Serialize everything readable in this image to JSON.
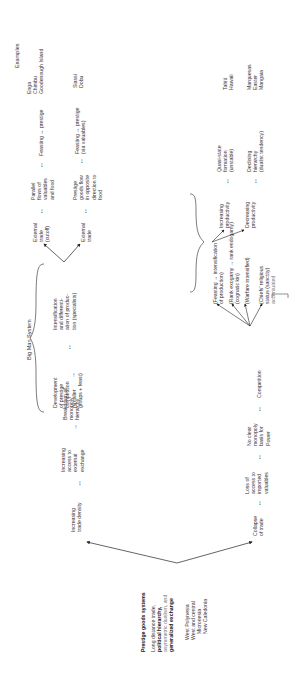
{
  "root": {
    "title": "Prestige goods systems",
    "lines": [
      "Long distance trade,",
      "political hierarchy,",
      "asymmetric dualism, and",
      "generalized exchange"
    ],
    "examples": [
      "West Polynesia",
      "West and central",
      "Micronesia",
      "New Caledonia"
    ]
  },
  "examples_header": "Examples",
  "upper_branch": {
    "start": [
      "Increasing",
      "trade density"
    ],
    "step2": [
      "Increasing",
      "access to",
      "external",
      "exchange"
    ],
    "step3": [
      "Breakdown of",
      "monopoly",
      "hierarchy"
    ],
    "big_man_label": "Big Man System",
    "step4": [
      "Development",
      "of prestige",
      "competition",
      "(smaller",
      "groups + feast)"
    ],
    "step5": [
      "Intensification",
      "and differenti-",
      "ation of produc-",
      "tion (specialists)"
    ],
    "row_a": {
      "trade": [
        "External",
        "trade",
        "(cutoff)"
      ],
      "flows": [
        "Parallel",
        "flows of",
        "valuables",
        "and food"
      ],
      "result": "Feasting ↔ prestige",
      "examples": [
        "Enga",
        "Chimbu",
        "Goodenough Island"
      ]
    },
    "row_b": {
      "trade": [
        "External",
        "trade"
      ],
      "flows": [
        "Prestige",
        "goods flow",
        "in opposite",
        "direction to",
        "food"
      ],
      "result": [
        "Feasting ↔ prestige",
        "(via valuables)"
      ],
      "examples": [
        "Siassi",
        "Dobu"
      ]
    }
  },
  "lower_branch": {
    "start": [
      "Collapse",
      "of trade"
    ],
    "step2": [
      "Loss of",
      "access to",
      "imported",
      "valuables"
    ],
    "step3": [
      "No clear",
      "monopoly",
      "basis for",
      "Power"
    ],
    "competition": "Competition",
    "outcomes": [
      [
        "(Feasting → intensification",
        "of production)"
      ],
      [
        "(Rank exogamy → rank endogamy)",
        "(cognatic kin)"
      ],
      [
        "(Warfare intensified)"
      ],
      [
        "(Chiefs' religious",
        "status (sanctity)",
        "accentuated"
      ]
    ],
    "increasing": {
      "cause": [
        "Increasing",
        "productivity"
      ],
      "result": [
        "Quasi-state",
        "formation",
        "(unstable)"
      ],
      "examples": [
        "Tahiti",
        "Hawaii"
      ]
    },
    "decreasing": {
      "cause": [
        "Decreasing",
        "productivity"
      ],
      "result": [
        "Declining",
        "hierarchy",
        "(dualist tendency)"
      ],
      "examples": [
        "Marquesas",
        "Easter",
        "Mangaia"
      ]
    }
  },
  "arrows": {
    "right": "→",
    "double": "↔"
  }
}
